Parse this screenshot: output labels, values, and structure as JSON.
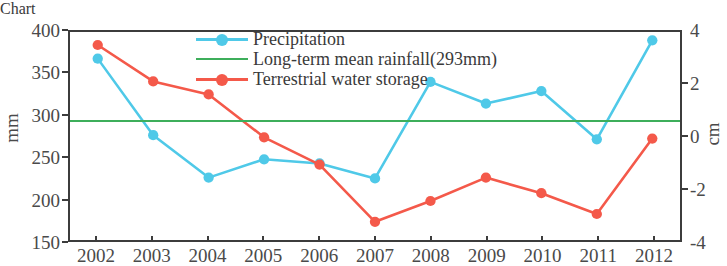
{
  "chart_data": {
    "type": "line",
    "title": "",
    "xlabel": "",
    "ylabel": "mm",
    "ylabel_right": "cm",
    "categories": [
      "2002",
      "2003",
      "2004",
      "2005",
      "2006",
      "2007",
      "2008",
      "2009",
      "2010",
      "2011",
      "2012"
    ],
    "ylim": [
      150,
      400
    ],
    "ylim_right": [
      -4,
      4
    ],
    "yticks": [
      "400",
      "350",
      "300",
      "250",
      "200",
      "150"
    ],
    "ytick_values": [
      400,
      350,
      300,
      250,
      200,
      150
    ],
    "yticks_right": [
      "4",
      "2",
      "0",
      "-2",
      "-4"
    ],
    "ytick_values_right": [
      4,
      2,
      0,
      -2,
      -4
    ],
    "grid": false,
    "legend_position": "top-center",
    "series": [
      {
        "name": "Precipitation",
        "axis": "left",
        "unit": "mm",
        "color": "#4FC9E8",
        "marker": "circle",
        "values": [
          368,
          276,
          225,
          247,
          242,
          224,
          340,
          314,
          329,
          271,
          390
        ]
      },
      {
        "name": "Terrestrial water storage",
        "axis": "right",
        "unit": "cm",
        "color": "#F4594A",
        "marker": "circle",
        "values": [
          3.5,
          2.1,
          1.6,
          -0.05,
          -1.1,
          -3.3,
          -2.5,
          -1.6,
          -2.2,
          -3.0,
          -0.1
        ]
      },
      {
        "name": "Long-term mean rainfall(293mm)",
        "axis": "left",
        "unit": "mm",
        "color": "#3EAE5B",
        "marker": "none",
        "type": "hline",
        "value": 293,
        "values": [
          293,
          293,
          293,
          293,
          293,
          293,
          293,
          293,
          293,
          293,
          293
        ]
      }
    ]
  },
  "legend": {
    "items": [
      {
        "label": "Precipitation",
        "color": "#4FC9E8",
        "marker": "circle"
      },
      {
        "label": "Long-term mean rainfall(293mm)",
        "color": "#3EAE5B",
        "marker": "none"
      },
      {
        "label": "Terrestrial water storage",
        "color": "#F4594A",
        "marker": "circle"
      }
    ]
  },
  "axes": {
    "left_label": "mm",
    "right_label": "cm",
    "left_ticks": [
      "400",
      "350",
      "300",
      "250",
      "200",
      "150"
    ],
    "right_ticks": [
      "4",
      "2",
      "0",
      "-2",
      "-4"
    ],
    "x_ticks": [
      "2002",
      "2003",
      "2004",
      "2005",
      "2006",
      "2007",
      "2008",
      "2009",
      "2010",
      "2011",
      "2012"
    ]
  },
  "colors": {
    "precipitation": "#4FC9E8",
    "terrestrial_water_storage": "#F4594A",
    "mean_rainfall": "#3EAE5B",
    "axis": "#3c3c3c",
    "text": "#4a4a4a",
    "background": "#ffffff"
  }
}
